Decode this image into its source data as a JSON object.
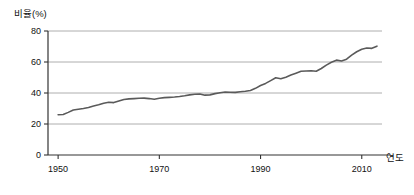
{
  "chart_data": {
    "type": "line",
    "title": "",
    "subtitle": "",
    "xlabel": "연도",
    "ylabel": "비율(%)",
    "xlim": [
      1948,
      2014
    ],
    "ylim": [
      0,
      80
    ],
    "grid": true,
    "grid_axis": "y",
    "legend": false,
    "legend_position": "none",
    "line_color": "#5a5a5a",
    "axis_color": "#333333",
    "grid_color": "#999999",
    "background_color": "#ffffff",
    "xticks": [
      1950,
      1970,
      1990,
      2010
    ],
    "xtick_labels": [
      "1950",
      "1970",
      "1990",
      "2010"
    ],
    "yticks": [
      0,
      20,
      40,
      60,
      80
    ],
    "ytick_labels": [
      "0",
      "20",
      "40",
      "60",
      "80"
    ],
    "series": [
      {
        "name": "비율(%)",
        "x": [
          1950,
          1951,
          1952,
          1953,
          1954,
          1955,
          1956,
          1957,
          1958,
          1959,
          1960,
          1961,
          1962,
          1963,
          1964,
          1965,
          1966,
          1967,
          1968,
          1969,
          1970,
          1971,
          1972,
          1973,
          1974,
          1975,
          1976,
          1977,
          1978,
          1979,
          1980,
          1981,
          1982,
          1983,
          1984,
          1985,
          1986,
          1987,
          1988,
          1989,
          1990,
          1991,
          1992,
          1993,
          1994,
          1995,
          1996,
          1997,
          1998,
          1999,
          2000,
          2001,
          2002,
          2003,
          2004,
          2005,
          2006,
          2007,
          2008,
          2009,
          2010,
          2011,
          2012,
          2013
        ],
        "values": [
          26.0,
          26.1,
          27.5,
          29.0,
          29.5,
          30.0,
          30.6,
          31.6,
          32.4,
          33.4,
          34.0,
          33.8,
          34.8,
          35.8,
          36.2,
          36.4,
          36.6,
          36.7,
          36.4,
          36.0,
          36.6,
          37.0,
          37.2,
          37.4,
          37.7,
          38.2,
          38.8,
          39.2,
          39.4,
          38.6,
          38.8,
          39.6,
          40.2,
          40.6,
          40.5,
          40.4,
          40.8,
          41.1,
          41.6,
          43.0,
          44.8,
          46.2,
          48.0,
          49.8,
          49.2,
          50.2,
          51.6,
          52.8,
          54.0,
          54.2,
          54.4,
          54.0,
          55.8,
          58.0,
          59.8,
          61.2,
          60.6,
          61.8,
          64.4,
          66.6,
          68.2,
          69.0,
          68.8,
          70.2
        ],
        "note_start_value": 26.0,
        "note_peak_value": 80.0,
        "note_end_value": 77.0
      }
    ],
    "annotations": []
  }
}
